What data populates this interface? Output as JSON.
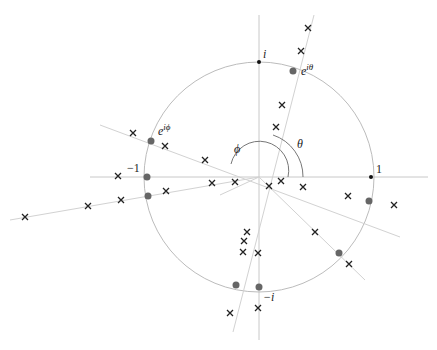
{
  "figure": {
    "type": "unit-circle-diagram",
    "labels": {
      "i": "i",
      "minus_i": "−i",
      "one": "1",
      "minus_one": "−1",
      "e_itheta": "e",
      "e_itheta_sup": "iθ",
      "e_iphi": "e",
      "e_iphi_sup": "iϕ",
      "theta": "θ",
      "phi": "ϕ"
    },
    "colors": {
      "axis": "#c8c8c8",
      "circle": "#bcbcbc",
      "point": "#666666",
      "cross": "#222222"
    }
  }
}
